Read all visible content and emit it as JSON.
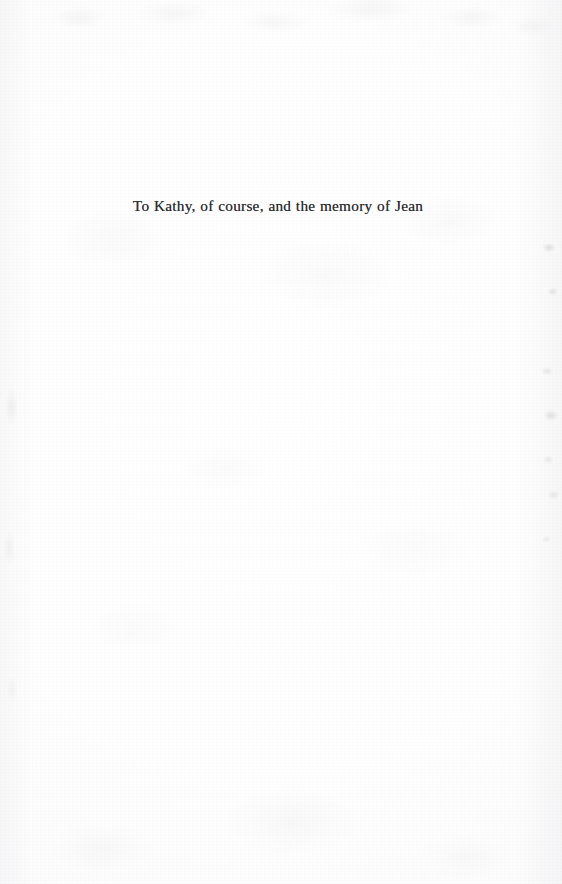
{
  "page": {
    "type": "book-dedication-page",
    "paper_color": "#fefefe",
    "ink_color": "#2a2a2e"
  },
  "dedication": {
    "text": "To Kathy, of course, and the memory of Jean"
  }
}
